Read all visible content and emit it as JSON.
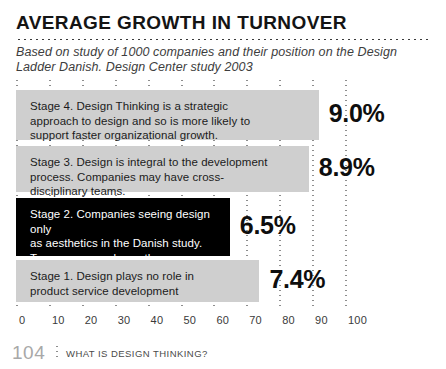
{
  "header": {
    "title": "AVERAGE GROWTH IN TURNOVER",
    "subtitle": "Based on study of 1000 companies and their position on the Design Ladder Danish. Design Center study 2003"
  },
  "footer": {
    "page_number": "104",
    "section_label": "WHAT IS DESIGN THINKING?"
  },
  "colors": {
    "bar_fill": "#cfcfcf",
    "bar_highlight": "#000000",
    "text": "#1b1b1b",
    "grid": "#8d8d8d",
    "page_number": "#a8a8a8"
  },
  "chart_data": {
    "type": "bar",
    "orientation": "horizontal",
    "title": "AVERAGE GROWTH IN TURNOVER",
    "subtitle": "Based on study of 1000 companies and their position on the Design Ladder Danish. Design Center study 2003",
    "xlabel": "",
    "ylabel": "",
    "xlim": [
      0,
      100
    ],
    "grid": true,
    "legend": "none",
    "xticks": [
      "0",
      "10",
      "20",
      "30",
      "40",
      "50",
      "60",
      "70",
      "80",
      "90",
      "100"
    ],
    "xtick_values": [
      0,
      10,
      20,
      30,
      40,
      50,
      60,
      70,
      80,
      90,
      100
    ],
    "categories": [
      "Stage 4. Design Thinking is a strategic approach to design and so is more likely to support faster organizational growth.",
      "Stage 3. Design is integral to the development process. Companies may have cross-disciplinary teams.",
      "Stage 2. Companies seeing design only as aesthetics in the Danish study. Turnover grew slower than companies not using design at all.",
      "Stage 1. Design plays no role in product service development"
    ],
    "values": [
      9.0,
      8.9,
      6.5,
      7.4
    ],
    "value_labels": [
      "9.0%",
      "8.9%",
      "6.5%",
      "7.4%"
    ],
    "bar_lengths_axis_units": [
      92,
      89,
      65,
      74
    ],
    "bars": [
      {
        "id": "stage-4",
        "label": "Stage 4. Design Thinking is a strategic\napproach to design and so is more likely to\nsupport faster organizational growth.",
        "value_label": "9.0%",
        "value": 9.0,
        "length": 92,
        "highlighted": false
      },
      {
        "id": "stage-3",
        "label": "Stage 3. Design is integral to the development\nprocess. Companies may have cross-\ndisciplinary teams.",
        "value_label": "8.9%",
        "value": 8.9,
        "length": 89,
        "highlighted": false
      },
      {
        "id": "stage-2",
        "label": "Stage 2. Companies seeing design only\nas aesthetics in the Danish study.\nTurnover grew slower than companies\nnot using design at all.",
        "value_label": "6.5%",
        "value": 6.5,
        "length": 65,
        "highlighted": true
      },
      {
        "id": "stage-1",
        "label": "Stage 1. Design plays no role in\nproduct service development",
        "value_label": "7.4%",
        "value": 7.4,
        "length": 74,
        "highlighted": false
      }
    ]
  }
}
